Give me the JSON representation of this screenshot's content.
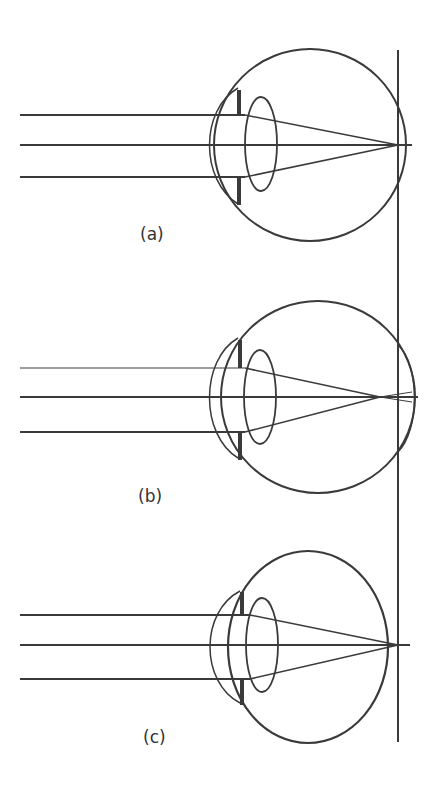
{
  "diagram": {
    "panels": [
      {
        "id": "a",
        "label": "(a)",
        "description": "normal eye - rays focus on retina"
      },
      {
        "id": "b",
        "label": "(b)",
        "description": "elongated eye - rays focus in front of retina"
      },
      {
        "id": "c",
        "label": "(c)",
        "description": "short eye - rays focus behind retina"
      }
    ],
    "colors": {
      "line": "#3a3a3a",
      "background": "#ffffff"
    }
  }
}
